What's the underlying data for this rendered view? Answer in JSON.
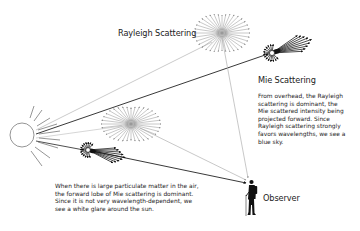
{
  "labels": {
    "rayleigh": "Rayleigh Scattering",
    "mie": "Mie Scattering",
    "observer": "Observer"
  },
  "captions": {
    "overhead": "From overhead, the Rayleigh\nscattering is dominant, the\nMie scattered intensity being\nprojected forward.  Since\nRayleigh scattering strongly\nfavors wavelengths, we see a\nblue sky.",
    "sun_glare": "When there is large particulate matter in the air,\nthe forward lobe of Mie scattering is dominant.\nSince it is not very wavelength-dependent, we\nsee a white glare around the sun."
  },
  "elements": {
    "sun": "sun-icon",
    "rayleigh_scatterers": 2,
    "mie_scatterers": 2,
    "observer": "hiker-silhouette-icon"
  },
  "colors": {
    "rayleigh": "#8a8a8a",
    "mie": "#111111",
    "light_ray": "#b5b5b5",
    "text": "#222222"
  }
}
